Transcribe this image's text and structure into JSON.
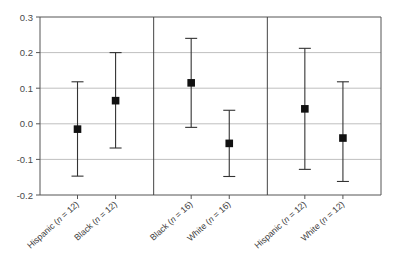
{
  "chart_data": {
    "type": "scatter",
    "title": "",
    "subtitle": "",
    "xlabel": "",
    "ylabel": "",
    "ylim": [
      -0.2,
      0.3
    ],
    "yticks": [
      0.3,
      0.2,
      0.1,
      0.0,
      -0.1,
      -0.2
    ],
    "ytick_labels": [
      "0.3",
      "0.2",
      "0.1",
      "0.0",
      "-0.1",
      "-0.2"
    ],
    "grid": "horizontal",
    "legend": "none",
    "marker": "filled-square",
    "error_bars": "vertical-with-caps",
    "panels": [
      {
        "index": 1,
        "points": [
          {
            "label": "Hispanic (n = 12)",
            "group": "Hispanic",
            "n": 12,
            "value": -0.015,
            "ci_low": -0.147,
            "ci_high": 0.118
          },
          {
            "label": "Black (n = 12)",
            "group": "Black",
            "n": 12,
            "value": 0.065,
            "ci_low": -0.068,
            "ci_high": 0.2
          }
        ]
      },
      {
        "index": 2,
        "points": [
          {
            "label": "Black (n = 16)",
            "group": "Black",
            "n": 16,
            "value": 0.115,
            "ci_low": -0.01,
            "ci_high": 0.24
          },
          {
            "label": "White (n = 16)",
            "group": "White",
            "n": 16,
            "value": -0.055,
            "ci_low": -0.148,
            "ci_high": 0.038
          }
        ]
      },
      {
        "index": 3,
        "points": [
          {
            "label": "Hispanic (n = 12)",
            "group": "Hispanic",
            "n": 12,
            "value": 0.042,
            "ci_low": -0.128,
            "ci_high": 0.212
          },
          {
            "label": "White (n = 12)",
            "group": "White",
            "n": 12,
            "value": -0.04,
            "ci_low": -0.162,
            "ci_high": 0.118
          }
        ]
      }
    ],
    "categories": [
      "Hispanic (n = 12)",
      "Black (n = 12)",
      "Black (n = 16)",
      "White (n = 16)",
      "Hispanic (n = 12)",
      "White (n = 12)"
    ],
    "values": [
      -0.015,
      0.065,
      0.115,
      -0.055,
      0.042,
      -0.04
    ],
    "ci_low": [
      -0.147,
      -0.068,
      -0.01,
      -0.148,
      -0.128,
      -0.162
    ],
    "ci_high": [
      0.118,
      0.2,
      0.24,
      0.038,
      0.212,
      0.118
    ]
  },
  "axis": {
    "y_ticks": [
      {
        "label": "0.3",
        "value": 0.3
      },
      {
        "label": "0.2",
        "value": 0.2
      },
      {
        "label": "0.1",
        "value": 0.1
      },
      {
        "label": "0.0",
        "value": 0.0
      },
      {
        "label": "-0.1",
        "value": -0.1
      },
      {
        "label": "-0.2",
        "value": -0.2
      }
    ]
  },
  "colors": {
    "marker": "#111111",
    "error_bar": "#333333",
    "gridline": "#b8b8b8",
    "axis": "#555555",
    "panel_divider": "#444444",
    "text": "#3c3c3c",
    "background": "#ffffff"
  },
  "category_labels": [
    {
      "name": "Hispanic",
      "n_prefix": "(",
      "n_italic": "n",
      "n_rest": " = 12)"
    },
    {
      "name": "Black",
      "n_prefix": "(",
      "n_italic": "n",
      "n_rest": " = 12)"
    },
    {
      "name": "Black",
      "n_prefix": "(",
      "n_italic": "n",
      "n_rest": " = 16)"
    },
    {
      "name": "White",
      "n_prefix": "(",
      "n_italic": "n",
      "n_rest": " = 16)"
    },
    {
      "name": "Hispanic",
      "n_prefix": "(",
      "n_italic": "n",
      "n_rest": " = 12)"
    },
    {
      "name": "White",
      "n_prefix": "(",
      "n_italic": "n",
      "n_rest": " = 12)"
    }
  ]
}
